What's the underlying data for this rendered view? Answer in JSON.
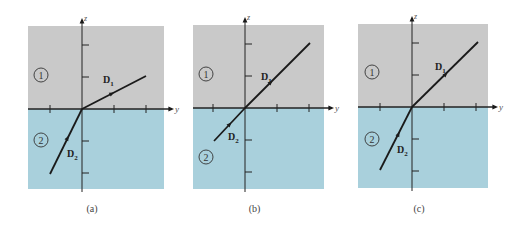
{
  "figure": {
    "colors": {
      "region1": "#c9c9c9",
      "region2": "#a9d0dc",
      "axis": "#222222",
      "line": "#1a1a1a",
      "background": "#ffffff"
    },
    "axis_labels": {
      "vertical": "z",
      "horizontal": "y"
    },
    "region_labels": [
      "1",
      "2"
    ],
    "vector_labels": {
      "upper": "D",
      "upper_sub": "1",
      "lower": "D",
      "lower_sub": "2"
    },
    "panels": [
      {
        "caption": "(a)",
        "box": {
          "x": 28,
          "y": 26,
          "w": 136,
          "h": 163
        },
        "origin": {
          "x": 82,
          "y": 109
        },
        "d1_end": {
          "x": 146,
          "y": 76
        },
        "d1_arrow": {
          "x": 111,
          "y": 94
        },
        "d1_label": {
          "x": 103,
          "y": 83
        },
        "d2_start": {
          "x": 50,
          "y": 174
        },
        "d2_arrow": {
          "x": 67,
          "y": 139
        },
        "d2_label": {
          "x": 67,
          "y": 157
        },
        "region1_label": {
          "x": 41,
          "y": 75
        },
        "region2_label": {
          "x": 41,
          "y": 140
        }
      },
      {
        "caption": "(b)",
        "box": {
          "x": 193,
          "y": 25,
          "w": 131,
          "h": 164
        },
        "origin": {
          "x": 245,
          "y": 108
        },
        "d1_end": {
          "x": 310,
          "y": 43
        },
        "d1_arrow": {
          "x": 270,
          "y": 83
        },
        "d1_label": {
          "x": 261,
          "y": 80
        },
        "d2_start": {
          "x": 214,
          "y": 141
        },
        "d2_arrow": {
          "x": 229,
          "y": 125
        },
        "d2_label": {
          "x": 228,
          "y": 140
        },
        "region1_label": {
          "x": 206,
          "y": 74
        },
        "region2_label": {
          "x": 206,
          "y": 157
        }
      },
      {
        "caption": "(c)",
        "box": {
          "x": 358,
          "y": 24,
          "w": 130,
          "h": 164
        },
        "origin": {
          "x": 412,
          "y": 107
        },
        "d1_end": {
          "x": 478,
          "y": 42
        },
        "d1_arrow": {
          "x": 445,
          "y": 75
        },
        "d1_label": {
          "x": 435,
          "y": 70
        },
        "d2_start": {
          "x": 380,
          "y": 170
        },
        "d2_arrow": {
          "x": 398,
          "y": 135
        },
        "d2_label": {
          "x": 397,
          "y": 153
        },
        "region1_label": {
          "x": 372,
          "y": 72
        },
        "region2_label": {
          "x": 372,
          "y": 139
        }
      }
    ],
    "tick_spacing": 32
  }
}
